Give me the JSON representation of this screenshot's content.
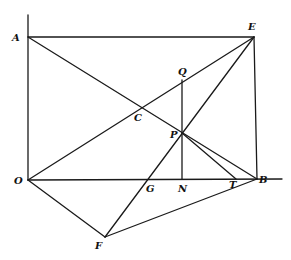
{
  "diagram": {
    "type": "geometric-construction",
    "points": {
      "A": {
        "label": "A",
        "x": 28,
        "y": 37,
        "lx": 12,
        "ly": 41
      },
      "E": {
        "label": "E",
        "x": 254,
        "y": 37,
        "lx": 248,
        "ly": 30
      },
      "O": {
        "label": "O",
        "x": 28,
        "y": 180,
        "lx": 14,
        "ly": 184
      },
      "B": {
        "label": "B",
        "x": 257,
        "y": 179,
        "lx": 259,
        "ly": 183
      },
      "F": {
        "label": "F",
        "x": 105,
        "y": 237,
        "lx": 95,
        "ly": 249
      },
      "C": {
        "label": "C",
        "x": 142,
        "y": 109,
        "lx": 134,
        "ly": 121
      },
      "Q": {
        "label": "Q",
        "x": 182,
        "y": 80,
        "lx": 178,
        "ly": 75
      },
      "P": {
        "label": "P",
        "x": 182,
        "y": 133,
        "lx": 170,
        "ly": 138
      },
      "N": {
        "label": "N",
        "x": 182,
        "y": 179,
        "lx": 178,
        "ly": 192
      },
      "G": {
        "label": "G",
        "x": 150,
        "y": 179,
        "lx": 146,
        "ly": 192
      },
      "T": {
        "label": "T",
        "x": 236,
        "y": 179,
        "lx": 229,
        "ly": 188
      }
    },
    "segments": [
      [
        "A",
        "E"
      ],
      [
        "A",
        "B"
      ],
      [
        "O",
        "E"
      ],
      [
        "O",
        "B"
      ],
      [
        "E",
        "B"
      ],
      [
        "O",
        "F"
      ],
      [
        "F",
        "E"
      ],
      [
        "F",
        "B"
      ],
      [
        "Q",
        "N"
      ],
      [
        "P",
        "T"
      ]
    ],
    "axes": {
      "vertical": {
        "x": 28,
        "y1": 15,
        "y2": 180
      },
      "horizontal_extension": {
        "y": 179,
        "x1": 257,
        "x2": 282
      }
    },
    "colors": {
      "ink": "#1a1a1a",
      "background": "#ffffff"
    }
  }
}
